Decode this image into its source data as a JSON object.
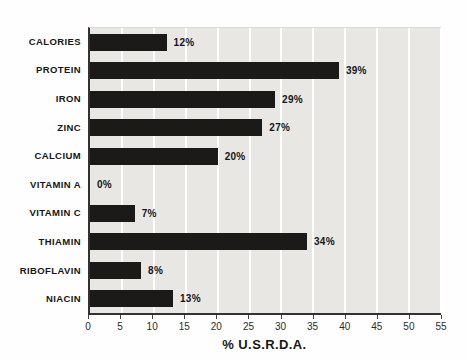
{
  "chart_data": {
    "type": "bar",
    "orientation": "horizontal",
    "title": "",
    "xlabel": "% U.S.R.D.A.",
    "ylabel": "",
    "categories": [
      "CALORIES",
      "PROTEIN",
      "IRON",
      "ZINC",
      "CALCIUM",
      "VITAMIN A",
      "VITAMIN C",
      "THIAMIN",
      "RIBOFLAVIN",
      "NIACIN"
    ],
    "values": [
      12,
      39,
      29,
      27,
      20,
      0,
      7,
      34,
      8,
      13
    ],
    "value_labels": [
      "12%",
      "39%",
      "29%",
      "27%",
      "20%",
      "0%",
      "7%",
      "34%",
      "8%",
      "13%"
    ],
    "xlim": [
      0,
      55
    ],
    "xticks": [
      0,
      5,
      10,
      15,
      20,
      25,
      30,
      35,
      40,
      45,
      50,
      55
    ],
    "grid": "vertical white gridlines every 5 units",
    "legend": "none",
    "colors": {
      "bar": "#1b1a18",
      "plot_background": "#e8e7e4",
      "gridline": "#ffffff",
      "axis": "#333230",
      "text": "#161616"
    }
  }
}
